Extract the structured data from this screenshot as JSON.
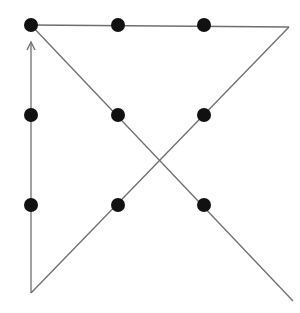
{
  "diagram": {
    "background": "#ffffff",
    "line_color": "#6e6e6e",
    "dot_color": "#111111",
    "dot_radius": 7,
    "dots": [
      {
        "row": 0,
        "col": 0,
        "x": 31,
        "y": 25
      },
      {
        "row": 0,
        "col": 1,
        "x": 118,
        "y": 25
      },
      {
        "row": 0,
        "col": 2,
        "x": 204,
        "y": 25
      },
      {
        "row": 1,
        "col": 0,
        "x": 31,
        "y": 115
      },
      {
        "row": 1,
        "col": 1,
        "x": 118,
        "y": 115
      },
      {
        "row": 1,
        "col": 2,
        "x": 204,
        "y": 115
      },
      {
        "row": 2,
        "col": 0,
        "x": 31,
        "y": 205
      },
      {
        "row": 2,
        "col": 1,
        "x": 118,
        "y": 205
      },
      {
        "row": 2,
        "col": 2,
        "x": 204,
        "y": 205
      }
    ],
    "path": [
      {
        "x": 31,
        "y": 25
      },
      {
        "x": 289,
        "y": 27
      },
      {
        "x": 31,
        "y": 293
      },
      {
        "x": 31,
        "y": 42
      }
    ],
    "diagonal": {
      "x1": 31,
      "y1": 25,
      "x2": 293,
      "y2": 301
    },
    "arrow": {
      "x": 31,
      "y": 42,
      "direction": "up"
    }
  }
}
